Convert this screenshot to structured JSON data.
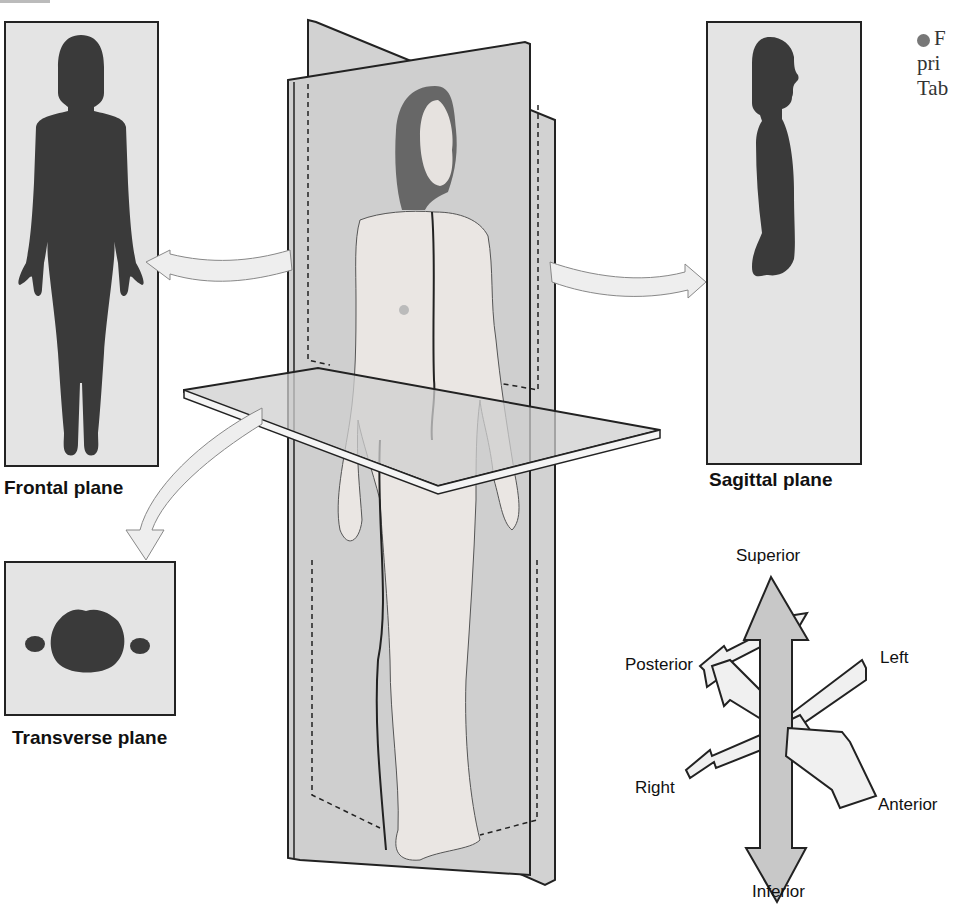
{
  "figure": {
    "caption_fragment": {
      "bullet": "●",
      "lines": [
        "F",
        "pri",
        "Tab"
      ]
    },
    "planes": [
      {
        "id": "frontal",
        "label": "Frontal plane",
        "view": "front silhouette"
      },
      {
        "id": "sagittal",
        "label": "Sagittal plane",
        "view": "side silhouette"
      },
      {
        "id": "transverse",
        "label": "Transverse plane",
        "view": "cross-section"
      }
    ],
    "directions": {
      "superior": "Superior",
      "inferior": "Inferior",
      "left": "Left",
      "right": "Right",
      "anterior": "Anterior",
      "posterior": "Posterior"
    },
    "colors": {
      "silhouette": "#3a3a3a",
      "panel_bg": "#e4e4e4",
      "plane_fill": "#d6d6d6",
      "arrow_fill": "#eeeeee",
      "vertical_arrow_fill": "#c8c8c8",
      "outline": "#222222"
    }
  }
}
